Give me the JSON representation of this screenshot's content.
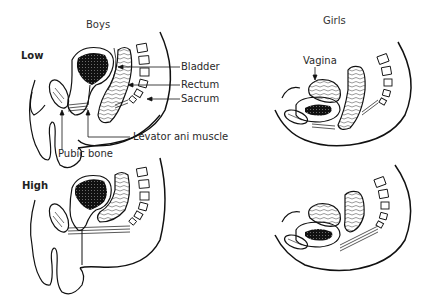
{
  "headers": {
    "boys": "Boys",
    "girls": "Girls"
  },
  "rows": {
    "low": "Low",
    "high": "High"
  },
  "labels": {
    "bladder": "Bladder",
    "rectum": "Rectum",
    "sacrum": "Sacrum",
    "levator": "Levator ani muscle",
    "pubic_bone": "Pubic bone",
    "vagina": "Vagina"
  },
  "panels": [
    {
      "id": "boys-low",
      "sex": "Boys",
      "level": "Low"
    },
    {
      "id": "girls-low",
      "sex": "Girls",
      "level": "Low"
    },
    {
      "id": "boys-high",
      "sex": "Boys",
      "level": "High"
    },
    {
      "id": "girls-high",
      "sex": "Girls",
      "level": "High"
    }
  ]
}
